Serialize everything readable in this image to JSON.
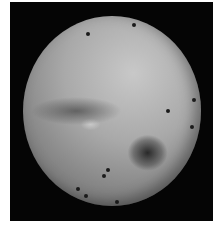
{
  "image": {
    "description": "Grayscale early spacecraft image of a planetary disk (Mars-like) on black background with dark reseau dots",
    "colors": {
      "background": "#ffffff",
      "frame": "#050505",
      "disk_light": "#c8c8c8",
      "disk_dark": "#5a5a5a",
      "spot": "#1a1a1a"
    },
    "spots": [
      {
        "x": 88,
        "y": 34
      },
      {
        "x": 134,
        "y": 25
      },
      {
        "x": 194,
        "y": 100
      },
      {
        "x": 168,
        "y": 111
      },
      {
        "x": 192,
        "y": 127
      },
      {
        "x": 104,
        "y": 176
      },
      {
        "x": 78,
        "y": 189
      },
      {
        "x": 86,
        "y": 196
      },
      {
        "x": 117,
        "y": 202
      },
      {
        "x": 108,
        "y": 170
      }
    ]
  }
}
